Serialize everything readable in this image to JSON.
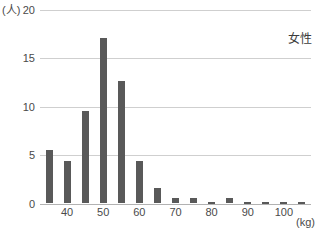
{
  "chart": {
    "y_axis_unit": "(人)",
    "x_axis_unit": "(kg)",
    "series_label": "女性"
  },
  "chart_data": {
    "type": "bar",
    "title": "",
    "categories": [
      35,
      40,
      45,
      50,
      55,
      60,
      65,
      70,
      75,
      80,
      85,
      90,
      95,
      100,
      105
    ],
    "values": [
      5.5,
      4.4,
      9.6,
      17.1,
      12.7,
      4.4,
      1.6,
      0.6,
      0.6,
      0.2,
      0.6,
      0.2,
      0.2,
      0.2,
      0.2
    ],
    "xlabel": "(kg)",
    "ylabel": "(人)",
    "ylim": [
      0,
      20
    ],
    "y_ticks": [
      20,
      15,
      10,
      5,
      0
    ],
    "x_tick_labels": [
      40,
      50,
      60,
      70,
      80,
      90,
      100
    ],
    "annotation": "女性",
    "legend_position": "top-right",
    "grid": "horizontal",
    "bar_color": "#595959",
    "grid_color": "#cfcfcf",
    "baseline_color": "#b2b2b2",
    "text_color": "#4a4a4a"
  }
}
